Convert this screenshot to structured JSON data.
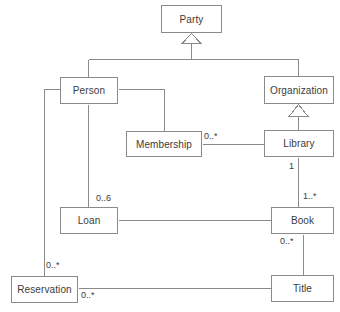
{
  "diagram": {
    "kind": "uml-class-diagram",
    "width": 340,
    "height": 312,
    "background": "#ffffff",
    "line_color": "#8a8a8a",
    "text_color": "#3b3b3b",
    "classes": [
      {
        "id": "party",
        "label": "Party",
        "x": 161,
        "y": 5,
        "w": 61,
        "h": 28
      },
      {
        "id": "person",
        "label": "Person",
        "x": 60,
        "y": 77,
        "w": 58,
        "h": 27
      },
      {
        "id": "organization",
        "label": "Organization",
        "x": 264,
        "y": 76,
        "w": 70,
        "h": 28
      },
      {
        "id": "membership",
        "label": "Membership",
        "x": 126,
        "y": 131,
        "w": 76,
        "h": 26
      },
      {
        "id": "library",
        "label": "Library",
        "x": 264,
        "y": 130,
        "w": 70,
        "h": 27
      },
      {
        "id": "loan",
        "label": "Loan",
        "x": 60,
        "y": 207,
        "w": 58,
        "h": 27
      },
      {
        "id": "book",
        "label": "Book",
        "x": 271,
        "y": 207,
        "w": 63,
        "h": 27
      },
      {
        "id": "reservation",
        "label": "Reservation",
        "x": 11,
        "y": 276,
        "w": 67,
        "h": 27
      },
      {
        "id": "title",
        "label": "Title",
        "x": 271,
        "y": 275,
        "w": 63,
        "h": 27
      }
    ],
    "multiplicities": [
      {
        "id": "membership-library",
        "text": "0..*",
        "x": 204,
        "y": 131
      },
      {
        "id": "library-book-one",
        "text": "1",
        "x": 289,
        "y": 161
      },
      {
        "id": "book-library-many",
        "text": "1..*",
        "x": 303,
        "y": 191
      },
      {
        "id": "person-loan",
        "text": "0..6",
        "x": 96,
        "y": 193
      },
      {
        "id": "book-title",
        "text": "0..*",
        "x": 280,
        "y": 236
      },
      {
        "id": "person-reservation",
        "text": "0..*",
        "x": 46,
        "y": 260
      },
      {
        "id": "reservation-title",
        "text": "0..*",
        "x": 81,
        "y": 290
      }
    ],
    "generalizations": [
      {
        "id": "person-to-party",
        "parent": "party",
        "child": "person"
      },
      {
        "id": "organization-to-party",
        "parent": "party",
        "child": "organization"
      },
      {
        "id": "library-to-organization",
        "parent": "organization",
        "child": "library"
      }
    ],
    "associations": [
      {
        "id": "person-membership",
        "from": "person",
        "to": "membership"
      },
      {
        "id": "membership-library",
        "from": "membership",
        "to": "library"
      },
      {
        "id": "library-book",
        "from": "library",
        "to": "book"
      },
      {
        "id": "person-loan",
        "from": "person",
        "to": "loan"
      },
      {
        "id": "loan-book",
        "from": "loan",
        "to": "book"
      },
      {
        "id": "book-title",
        "from": "book",
        "to": "title"
      },
      {
        "id": "person-reservation",
        "from": "person",
        "to": "reservation"
      },
      {
        "id": "reservation-title",
        "from": "reservation",
        "to": "title"
      }
    ]
  }
}
